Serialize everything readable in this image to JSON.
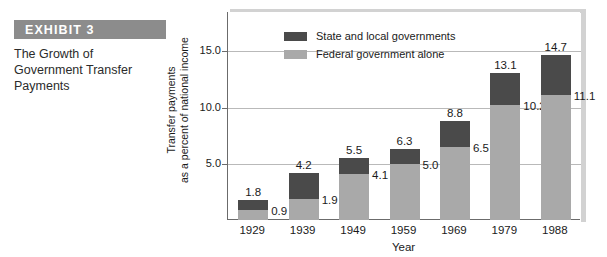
{
  "exhibit": {
    "banner_label": "EXHIBIT  3",
    "caption_lines": [
      "The Growth of",
      "Government Transfer",
      "Payments"
    ]
  },
  "colors": {
    "state_local": "#4a4a4a",
    "federal": "#a9a9a9",
    "banner": "#8c8c8c",
    "gridline": "#b9b9b9",
    "axis": "#6b6b6b"
  },
  "chart_data": {
    "type": "bar",
    "stacked": true,
    "title": "The Growth of Government Transfer Payments",
    "xlabel": "Year",
    "ylabel": "Transfer payments as a percent of national income",
    "ylabel_lines": [
      "Transfer payments",
      "as a percent of national income"
    ],
    "categories": [
      "1929",
      "1939",
      "1949",
      "1959",
      "1969",
      "1979",
      "1988"
    ],
    "series": [
      {
        "name": "Federal government alone",
        "values": [
          0.9,
          1.9,
          4.1,
          5.0,
          6.5,
          10.2,
          11.1
        ]
      },
      {
        "name": "State and local governments",
        "values": [
          0.9,
          2.3,
          1.4,
          1.3,
          2.3,
          2.9,
          3.6
        ]
      }
    ],
    "totals": [
      1.8,
      4.2,
      5.5,
      6.3,
      8.8,
      13.1,
      14.7
    ],
    "total_labels": [
      "1.8",
      "4.2",
      "5.5",
      "6.3",
      "8.8",
      "13.1",
      "14.7"
    ],
    "federal_labels": [
      "0.9",
      "1.9",
      "4.1",
      "5.0",
      "6.5",
      "10.2",
      "11.1"
    ],
    "yticks": [
      5.0,
      10.0,
      15.0
    ],
    "ytick_labels": [
      "5.0",
      "10.0",
      "15.0"
    ],
    "ylim": [
      0,
      18.5
    ],
    "grid": true,
    "legend_position": "top-center",
    "legend": [
      "State and local governments",
      "Federal government alone"
    ]
  }
}
